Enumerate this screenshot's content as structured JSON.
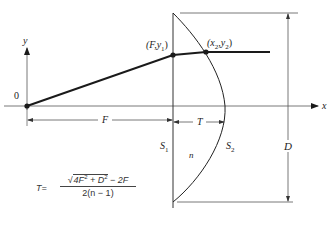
{
  "diagram": {
    "type": "lens-ray-geometry",
    "axes": {
      "x_label": "x",
      "y_label": "y",
      "origin_label": "0"
    },
    "points": [
      {
        "id": "origin",
        "label": "0"
      },
      {
        "id": "p1",
        "label_main": "(F,y",
        "label_sub": "1",
        "label_end": ")"
      },
      {
        "id": "p2",
        "label_main": "(x",
        "label_sub1": "2",
        "label_mid": ",y",
        "label_sub2": "2",
        "label_end": ")"
      }
    ],
    "surfaces": [
      {
        "id": "s1",
        "label_main": "S",
        "label_sub": "1",
        "shape": "plane"
      },
      {
        "id": "s2",
        "label_main": "S",
        "label_sub": "2",
        "shape": "curved"
      }
    ],
    "medium_label": "n",
    "dimensions": {
      "focal": "F",
      "thickness": "T",
      "diameter": "D"
    },
    "formula": {
      "lhs": "T=",
      "numerator_parts": [
        "4F",
        "2",
        " + D",
        "2",
        " − 2F"
      ],
      "denominator": "2(n − 1)"
    },
    "colors": {
      "line": "#1a1a1a",
      "thin_line": "#555555",
      "background": "#ffffff"
    }
  }
}
